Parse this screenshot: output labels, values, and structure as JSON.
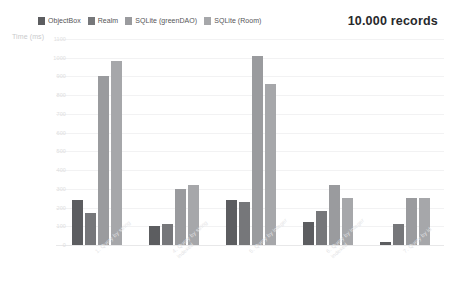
{
  "header": {
    "records_title": "10.000 records"
  },
  "legend": {
    "items": [
      {
        "label": "ObjectBox",
        "color": "#5c5d60"
      },
      {
        "label": "Realm",
        "color": "#76777a"
      },
      {
        "label": "SQLite (greenDAO)",
        "color": "#9a9b9e"
      },
      {
        "label": "SQLite (Room)",
        "color": "#a6a7aa"
      }
    ]
  },
  "chart_data": {
    "type": "bar",
    "title": "10.000 records",
    "xlabel": "",
    "ylabel": "Time (ms)",
    "ylim": [
      0,
      1100
    ],
    "yticks": [
      0,
      100,
      200,
      300,
      400,
      500,
      600,
      700,
      800,
      900,
      1000,
      1100
    ],
    "grid": true,
    "legend_position": "top-left",
    "categories": [
      "1. Query by string",
      "4. Query by string indexed",
      "5. Query by integer",
      "6. Query by integer indexed",
      "7. Query by id"
    ],
    "category_lines": [
      [
        "1. Query by string",
        ""
      ],
      [
        "4. Query by string",
        "indexed"
      ],
      [
        "5. Query by integer",
        ""
      ],
      [
        "6. Query by integer",
        "indexed"
      ],
      [
        "7. Query by id",
        ""
      ]
    ],
    "series": [
      {
        "name": "ObjectBox",
        "color": "#5c5d60",
        "values": [
          240,
          100,
          240,
          125,
          15
        ]
      },
      {
        "name": "Realm",
        "color": "#76777a",
        "values": [
          170,
          110,
          230,
          180,
          110
        ]
      },
      {
        "name": "SQLite (greenDAO)",
        "color": "#9a9b9e",
        "values": [
          900,
          300,
          1010,
          320,
          250
        ]
      },
      {
        "name": "SQLite (Room)",
        "color": "#a6a7aa",
        "values": [
          980,
          320,
          860,
          250,
          250
        ]
      }
    ]
  }
}
